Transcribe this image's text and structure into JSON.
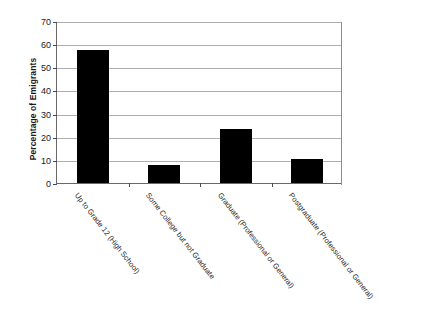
{
  "chart_data": {
    "type": "bar",
    "title": "",
    "xlabel": "",
    "ylabel": "Percentage of Emigrants",
    "ylim": [
      0,
      70
    ],
    "yticks": [
      0,
      10,
      20,
      30,
      40,
      50,
      60,
      70
    ],
    "grid": "horizontal",
    "legend": "none",
    "bar_color": "#000000",
    "categories": [
      "Up to Grade 12 (High School)",
      "Some College but not Graduate",
      "Graduate (Professional or General)",
      "Postgraduate (Professional or General)"
    ],
    "values": [
      57.5,
      8.0,
      23.5,
      10.5
    ]
  },
  "caption": {
    "text": ""
  }
}
